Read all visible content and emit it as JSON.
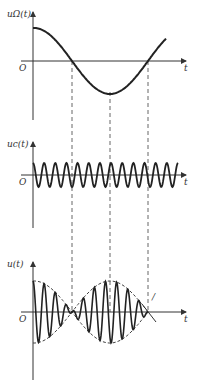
{
  "diagram": {
    "title": "",
    "colors": {
      "ink": "#222222",
      "axis": "#333333",
      "dash": "#555555",
      "background": "#ffffff"
    },
    "panels": [
      {
        "id": "modulating",
        "y_label": "uΩ(t)",
        "x_label": "t",
        "origin_label": "O",
        "signal": "cosine, slightly over one period",
        "axis": {
          "x0": 33,
          "y_top": 12,
          "y_bottom": 120,
          "t_y": 61,
          "t_end": 186
        },
        "curve": {
          "start_amp": 33,
          "zeros_x": [
            72,
            148
          ],
          "min_x": 110,
          "min_y": 92,
          "end_x": 166
        }
      },
      {
        "id": "carrier",
        "y_label": "uc(t)",
        "x_label": "t",
        "origin_label": "O",
        "signal": "high-frequency cosine carrier, ~13 cycles",
        "axis": {
          "x0": 33,
          "y_top": 142,
          "y_bottom": 228,
          "t_y": 175,
          "t_end": 186
        },
        "curve": {
          "amp": 12,
          "cycles": 13,
          "end_x": 178
        }
      },
      {
        "id": "dsb",
        "y_label": "u(t)",
        "x_label": "t",
        "origin_label": "O",
        "signal": "DSB-SC product with dashed envelope; phase reversal at envelope zeros",
        "axis": {
          "x0": 33,
          "y_top": 262,
          "y_bottom": 380,
          "t_y": 312,
          "t_end": 186
        },
        "curve": {
          "amp": 31,
          "cycles": 13,
          "end_x": 148
        },
        "envelope_extension_label": "/"
      }
    ],
    "dashed_guides_x": [
      72,
      110,
      148
    ]
  }
}
